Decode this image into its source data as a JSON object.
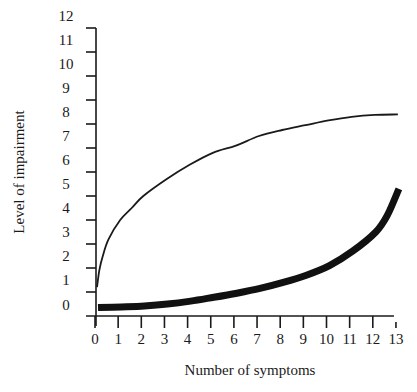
{
  "chart_data": {
    "type": "line",
    "title": "",
    "xlabel": "Number of symptoms",
    "ylabel": "Level of impairment",
    "xlim": [
      0,
      13
    ],
    "ylim": [
      0,
      12
    ],
    "x_ticks": [
      "0",
      "1",
      "2",
      "3",
      "4",
      "5",
      "6",
      "7",
      "8",
      "9",
      "10",
      "11",
      "12",
      "13"
    ],
    "y_ticks": [
      "0",
      "1",
      "2",
      "3",
      "4",
      "5",
      "6",
      "7",
      "8",
      "9",
      "10",
      "11",
      "12"
    ],
    "grid": false,
    "legend": null,
    "series": [
      {
        "name": "thin curve (rapid rise, plateau)",
        "style": "thin",
        "color": "#1a1a1a",
        "x": [
          0,
          0.1,
          0.25,
          0.5,
          1,
          1.5,
          2,
          3,
          4,
          5,
          6,
          7,
          8,
          9,
          10,
          11,
          12,
          13
        ],
        "y": [
          1.2,
          1.9,
          2.5,
          3.2,
          4.0,
          4.5,
          5.0,
          5.7,
          6.3,
          6.8,
          7.1,
          7.5,
          7.75,
          7.95,
          8.15,
          8.3,
          8.38,
          8.4
        ]
      },
      {
        "name": "thick curve (slow rise, acceleration)",
        "style": "thick",
        "color": "#111111",
        "x": [
          0,
          1,
          2,
          3,
          4,
          5,
          6,
          7,
          8,
          9,
          10,
          11,
          12,
          12.5,
          13
        ],
        "y": [
          0.35,
          0.38,
          0.42,
          0.5,
          0.62,
          0.78,
          0.95,
          1.15,
          1.4,
          1.7,
          2.1,
          2.7,
          3.5,
          4.2,
          5.3
        ]
      }
    ]
  }
}
